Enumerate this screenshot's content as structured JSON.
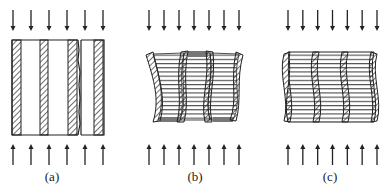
{
  "figure": {
    "panels": [
      {
        "id": "a",
        "label": "(a)",
        "state": "undeformed layered block with a crack (split) near the right",
        "top_arrows": 6,
        "bottom_arrows": 6,
        "arrow_direction_top": "down",
        "arrow_direction_bottom": "up"
      },
      {
        "id": "b",
        "label": "(b)",
        "state": "buckled layers, alternating (out-of-phase) mode",
        "top_arrows": 7,
        "bottom_arrows": 7,
        "arrow_direction_top": "down",
        "arrow_direction_bottom": "up"
      },
      {
        "id": "c",
        "label": "(c)",
        "state": "buckled layers, in-phase (shear) mode",
        "top_arrows": 7,
        "bottom_arrows": 7,
        "arrow_direction_top": "down",
        "arrow_direction_bottom": "up"
      }
    ]
  },
  "colors": {
    "ink": "#222222",
    "background": "#ffffff"
  }
}
